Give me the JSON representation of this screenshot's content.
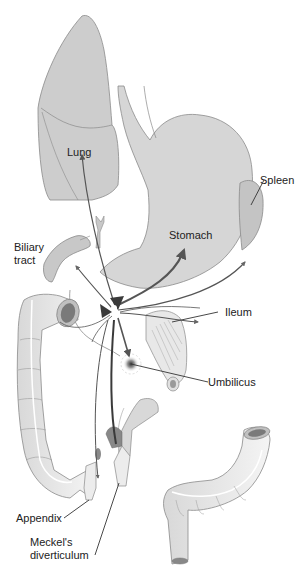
{
  "diagram": {
    "type": "anatomical-illustration",
    "colors": {
      "organ_fill": "#cfcfcf",
      "organ_fill_light": "#e6e6e6",
      "organ_stroke": "#8a8a8a",
      "arrow": "#555555",
      "arrow_dark": "#3a3a3a",
      "label_text": "#222222",
      "background": "#ffffff"
    },
    "labels": {
      "lung": "Lung",
      "spleen": "Spleen",
      "stomach": "Stomach",
      "biliary_line1": "Biliary",
      "biliary_line2": "tract",
      "ileum": "Ileum",
      "umbilicus": "Umbilicus",
      "appendix": "Appendix",
      "meckels_line1": "Meckel's",
      "meckels_line2": "diverticulum"
    },
    "structures": [
      "lung",
      "esophagus",
      "stomach",
      "spleen",
      "biliary-tract",
      "gallbladder",
      "duodenum",
      "ascending-colon",
      "ileum",
      "umbilicus",
      "appendix",
      "meckels-diverticulum",
      "transverse-sigmoid-colon",
      "central-origin-arrows"
    ]
  }
}
